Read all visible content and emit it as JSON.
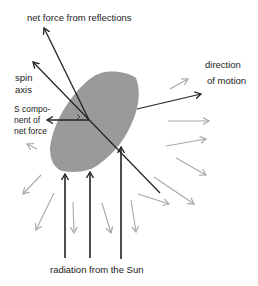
{
  "labels": {
    "net_force": "net force from reflections",
    "spin_axis_1": "spin",
    "spin_axis_2": "axis",
    "s_component_1": "S compo-",
    "s_component_2": "nent of",
    "s_component_3": "net force",
    "direction_1": "direction",
    "direction_2": "of motion",
    "radiation": "radiation from the Sun"
  },
  "colors": {
    "body_fill": "#9a9a9a",
    "force_line": "#222222",
    "reflection_arrow": "#a8a8a8",
    "background": "#ffffff"
  }
}
